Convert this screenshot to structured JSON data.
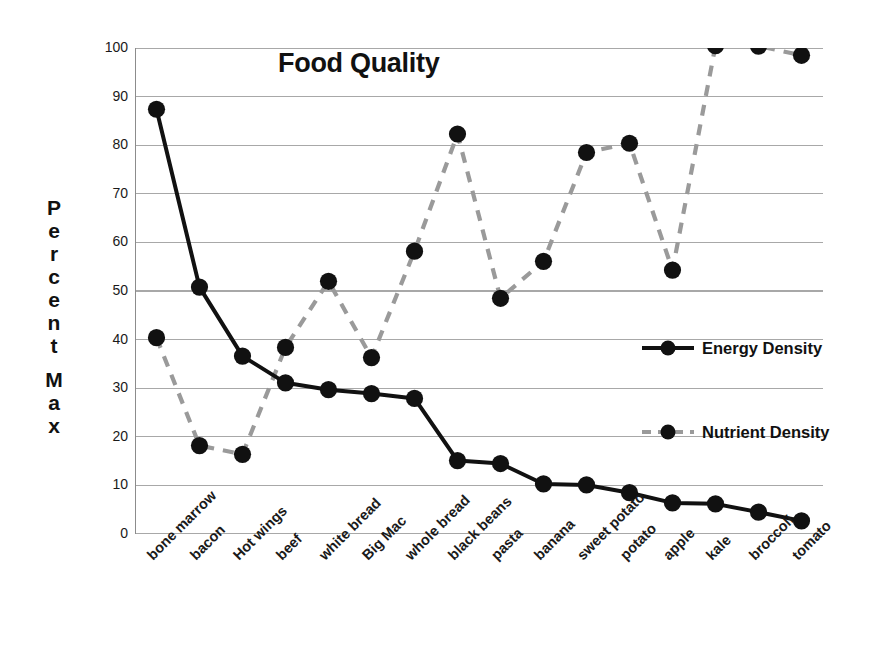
{
  "chart_data": {
    "type": "line",
    "title": "Food Quality",
    "xlabel": "",
    "ylabel": "Percent Max",
    "ylim": [
      0,
      100
    ],
    "yticks": [
      0,
      10,
      20,
      30,
      40,
      50,
      60,
      70,
      80,
      90,
      100
    ],
    "grid": true,
    "legend_position": "right-middle",
    "categories": [
      "bone marrow",
      "bacon",
      "Hot wings",
      "beef",
      "white bread",
      "Big Mac",
      "whole bread",
      "black beans",
      "pasta",
      "banana",
      "sweet potato",
      "potato",
      "apple",
      "kale",
      "broccoli",
      "tomato"
    ],
    "series": [
      {
        "name": "Energy Density",
        "color": "#111111",
        "linestyle": "solid",
        "marker": "circle",
        "values": [
          87.4,
          50.8,
          36.6,
          31.1,
          29.7,
          28.9,
          27.9,
          15.1,
          14.5,
          10.3,
          10.1,
          8.5,
          6.4,
          6.2,
          4.5,
          2.7
        ]
      },
      {
        "name": "Nutrient Density",
        "color": "#9a9a9a",
        "linestyle": "dashed",
        "marker": "circle",
        "values": [
          40.4,
          18.2,
          16.4,
          38.4,
          52.0,
          36.3,
          58.2,
          82.3,
          48.5,
          56.1,
          78.5,
          80.4,
          54.3,
          100.5,
          100.4,
          98.5
        ]
      }
    ]
  },
  "axis": {
    "y_title_words": [
      "Percent",
      "Max"
    ],
    "tick_labels": [
      "100",
      "90",
      "80",
      "70",
      "60",
      "50",
      "40",
      "30",
      "20",
      "10",
      "0"
    ]
  },
  "legend": {
    "items": [
      {
        "label": "Energy Density"
      },
      {
        "label": "Nutrient Density"
      }
    ]
  },
  "colors": {
    "energy": "#111111",
    "nutrient": "#9a9a9a",
    "grid": "#a8a8a8",
    "axis": "#8c8c8c",
    "text": "#1a1a1a",
    "background": "#ffffff"
  }
}
